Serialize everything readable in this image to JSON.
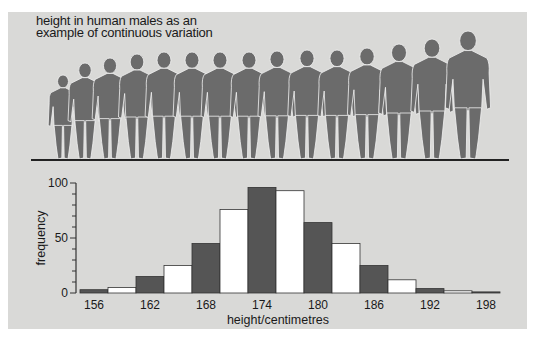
{
  "figure": {
    "title_lines": [
      "height in human males as an",
      "example of continuous variation"
    ],
    "silhouettes": {
      "count": 15,
      "centers_x": [
        63,
        85,
        110,
        137,
        164,
        192,
        220,
        249,
        277,
        307,
        337,
        367,
        399,
        432,
        468
      ],
      "head_top_y": [
        75,
        63,
        58,
        54,
        52,
        52,
        52,
        52,
        51,
        50,
        50,
        48,
        44,
        39,
        31
      ],
      "ground_y": 160,
      "color": "#6b6b6b"
    }
  },
  "chart_data": {
    "type": "bar",
    "title": "height in human males as an example of continuous variation",
    "xlabel": "height/centimetres",
    "ylabel": "frequency",
    "ylim": [
      0,
      100
    ],
    "yticks": [
      0,
      50,
      100
    ],
    "y_minor_step": 10,
    "xtick_labels": [
      "156",
      "162",
      "168",
      "174",
      "180",
      "186",
      "192",
      "198"
    ],
    "bin_width_cm": 3,
    "categories": [
      "156-159",
      "159-162",
      "162-165",
      "165-168",
      "168-171",
      "171-174",
      "174-177",
      "177-180",
      "180-183",
      "183-186",
      "186-189",
      "189-192",
      "192-195",
      "195-198",
      "198-201"
    ],
    "values": [
      3,
      5,
      15,
      25,
      45,
      76,
      96,
      93,
      64,
      45,
      25,
      12,
      4,
      2,
      1
    ],
    "bar_fill_alternating": [
      "#555555",
      "#ffffff"
    ],
    "grid": false,
    "legend": null
  },
  "colors": {
    "panel_bg": "#d9d9d7",
    "dark_bar": "#555555",
    "light_bar": "#ffffff",
    "axis": "#333333",
    "silhouette": "#6b6b6b"
  }
}
